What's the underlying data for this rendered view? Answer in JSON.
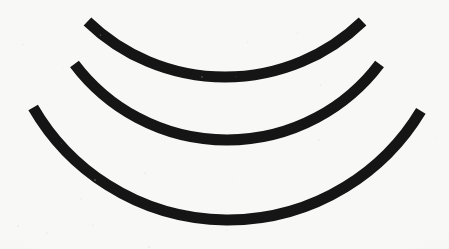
{
  "figure": {
    "background_color": "#f8f8f6",
    "stroke_color": "#151515",
    "width": 449,
    "height": 249
  },
  "chart_data": {
    "type": "line",
    "subtitle": "",
    "xlabel": "",
    "ylabel": "",
    "xlim": [
      0,
      449
    ],
    "ylim": [
      249,
      0
    ],
    "grid": false,
    "legend": "none",
    "annotations": [],
    "tick_labels": {
      "x": [],
      "y": []
    },
    "series": [
      {
        "name": "inner-arc",
        "shape": "circular-arc",
        "stroke_color": "#151515",
        "stroke_width": 11,
        "linecap": "butt",
        "center": [
          225,
          -121
        ],
        "radius": 198,
        "start_angle_deg": 134,
        "end_angle_deg": 46,
        "start_point": [
          92,
          20
        ],
        "bottom_point": [
          222,
          72
        ],
        "end_point": [
          364,
          21
        ],
        "x": [
          92,
          130,
          170,
          222,
          270,
          320,
          364
        ],
        "y": [
          20,
          44,
          61,
          72,
          67,
          46,
          21
        ]
      },
      {
        "name": "middle-arc",
        "shape": "circular-arc",
        "stroke_color": "#151515",
        "stroke_width": 11,
        "linecap": "butt",
        "center": [
          227,
          -51
        ],
        "radius": 191,
        "start_angle_deg": 143,
        "end_angle_deg": 37,
        "start_point": [
          51,
          24
        ],
        "bottom_point": [
          224,
          139
        ],
        "end_point": [
          406,
          27
        ],
        "x": [
          51,
          100,
          160,
          224,
          290,
          350,
          406
        ],
        "y": [
          24,
          78,
          118,
          139,
          130,
          92,
          27
        ]
      },
      {
        "name": "outer-arc",
        "shape": "circular-arc",
        "stroke_color": "#151515",
        "stroke_width": 11,
        "linecap": "butt",
        "center": [
          228,
          -5
        ],
        "radius": 225,
        "start_angle_deg": 150,
        "end_angle_deg": 31,
        "start_point": [
          32,
          35
        ],
        "bottom_point": [
          218,
          220
        ],
        "end_point": [
          421,
          32
        ],
        "x": [
          32,
          80,
          150,
          218,
          290,
          360,
          421
        ],
        "y": [
          35,
          110,
          178,
          220,
          208,
          150,
          32
        ]
      }
    ],
    "values": [
      198,
      191,
      225
    ],
    "categories": [
      "inner-arc",
      "middle-arc",
      "outer-arc"
    ]
  }
}
